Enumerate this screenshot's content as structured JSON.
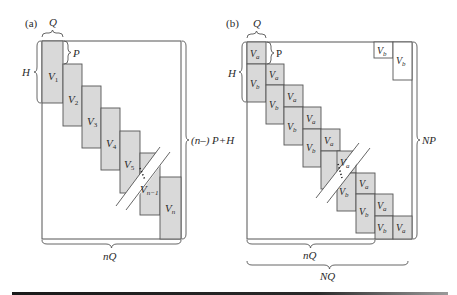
{
  "figure": {
    "panel_a": {
      "tag": "(a)",
      "labels": {
        "q": "Q",
        "p": "P",
        "h": "H",
        "height": "(n–) P+H",
        "width": "nQ"
      },
      "blocks": [
        "V",
        "V",
        "V",
        "V",
        "V",
        "V",
        "V"
      ],
      "block_subs": [
        "1",
        "2",
        "3",
        "4",
        "5",
        "n−1",
        "n"
      ]
    },
    "panel_b": {
      "tag": "(b)",
      "labels": {
        "q": "Q",
        "p": "P",
        "h": "H",
        "height": "NP",
        "width_inner": "nQ",
        "width_outer": "NQ"
      },
      "va": "V",
      "va_sub": "a",
      "vb": "V",
      "vb_sub": "b"
    }
  }
}
